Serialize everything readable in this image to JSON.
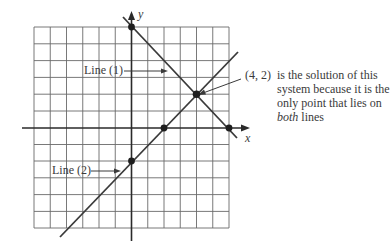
{
  "figure": {
    "axes": {
      "x_label": "x",
      "y_label": "y",
      "x_range": [
        -6,
        6
      ],
      "y_range": [
        -6,
        6
      ],
      "grid": true
    },
    "lines": [
      {
        "name": "Line (1)",
        "label": "Line (1)",
        "equation": "x + y = 6",
        "points": [
          [
            0,
            6
          ],
          [
            6,
            0
          ]
        ]
      },
      {
        "name": "Line (2)",
        "label": "Line (2)",
        "equation": "x - y = 2",
        "points": [
          [
            0,
            -2
          ],
          [
            2,
            0
          ]
        ]
      }
    ],
    "marked_points": [
      [
        0,
        6
      ],
      [
        6,
        0
      ],
      [
        0,
        -2
      ],
      [
        2,
        0
      ],
      [
        4,
        2
      ]
    ],
    "solution_point": "(4, 2)",
    "annotation": {
      "point_text": "(4, 2)",
      "line1": "is the solution of this",
      "line2": "system because it is the",
      "line3": "only point that lies on",
      "line4_italic": "both",
      "line4_rest": " lines"
    }
  }
}
